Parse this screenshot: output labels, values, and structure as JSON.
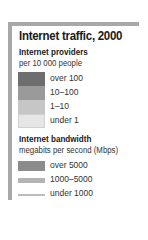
{
  "legend": {
    "title": "Internet traffic, 2000",
    "providers": {
      "title": "Internet providers",
      "subtitle": "per 10 000 people",
      "items": [
        {
          "label": "over 100",
          "color": "#6e6e6e"
        },
        {
          "label": "10–100",
          "color": "#9a9a9a"
        },
        {
          "label": "1–10",
          "color": "#c6c6c6"
        },
        {
          "label": "under 1",
          "color": "#e6e6e6"
        }
      ]
    },
    "bandwidth": {
      "title": "Internet bandwidth",
      "subtitle": "megabits per second (Mbps)",
      "items": [
        {
          "label": "over 5000",
          "color": "#8c8c8c",
          "thickness": 10
        },
        {
          "label": "1000–5000",
          "color": "#b4b4b4",
          "thickness": 5
        },
        {
          "label": "under 1000",
          "color": "#bcbcbc",
          "thickness": 2
        }
      ]
    },
    "frame_color": "#a8a8a8"
  }
}
